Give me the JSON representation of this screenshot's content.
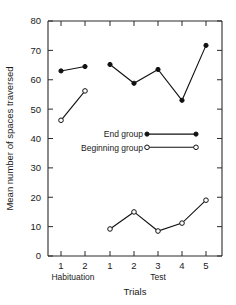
{
  "chart_data": {
    "type": "line",
    "title": "",
    "xlabel": "Trials",
    "ylabel": "Mean number of spaces traversed",
    "ylim": [
      0,
      80
    ],
    "yticks": [
      0,
      10,
      20,
      30,
      40,
      50,
      60,
      70,
      80
    ],
    "ytick_labels": [
      "0",
      "10",
      "20",
      "30",
      "40",
      "50",
      "60",
      "70",
      "80"
    ],
    "grid": false,
    "legend_position": "center-right",
    "phases": [
      {
        "name": "Habituation",
        "label": "Habituation",
        "trials": [
          "1",
          "2"
        ]
      },
      {
        "name": "Test",
        "label": "Test",
        "trials": [
          "1",
          "2",
          "3",
          "4",
          "5"
        ]
      }
    ],
    "xtick_labels": [
      "1",
      "2",
      "1",
      "2",
      "3",
      "4",
      "5"
    ],
    "series": [
      {
        "name": "End group",
        "marker": "filled-circle",
        "color": "#111111",
        "segments": [
          {
            "phase": "Habituation",
            "x": [
              "1",
              "2"
            ],
            "values": [
              63.0,
              64.5
            ]
          },
          {
            "phase": "Test",
            "x": [
              "1",
              "2",
              "3",
              "4",
              "5"
            ],
            "values": [
              65.2,
              58.8,
              63.5,
              53.0,
              71.7
            ]
          }
        ]
      },
      {
        "name": "Beginning group",
        "marker": "open-circle",
        "color": "#111111",
        "segments": [
          {
            "phase": "Habituation",
            "x": [
              "1",
              "2"
            ],
            "values": [
              46.2,
              56.2
            ]
          },
          {
            "phase": "Test",
            "x": [
              "1",
              "2",
              "3",
              "4",
              "5"
            ],
            "values": [
              9.2,
              15.0,
              8.5,
              11.2,
              19.0
            ]
          }
        ]
      }
    ],
    "legend": [
      {
        "label": "End group",
        "marker": "filled-circle"
      },
      {
        "label": "Beginning group",
        "marker": "open-circle"
      }
    ]
  }
}
